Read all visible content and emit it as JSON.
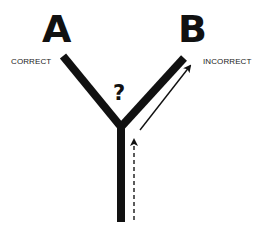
{
  "diagram": {
    "option_a": {
      "letter": "A",
      "label": "CORRECT"
    },
    "option_b": {
      "letter": "B",
      "label": "INCORRECT"
    },
    "junction_symbol": "?",
    "colors": {
      "line": "#111111",
      "background": "#ffffff",
      "text": "#222222"
    },
    "paths": {
      "stem": "solid thick vertical line from bottom to junction",
      "approach": "dashed arrow up along the stem",
      "chosen_path": "thin solid arrow toward B"
    }
  }
}
